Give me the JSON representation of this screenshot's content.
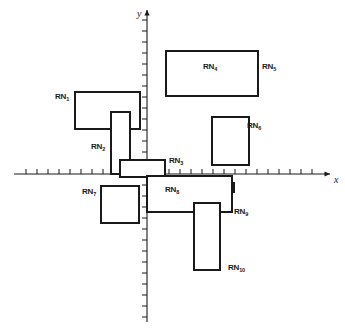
{
  "figure": {
    "type": "coordinate-plane-rectangle-diagram",
    "axes": {
      "x_label": "x",
      "y_label": "y",
      "origin_px": {
        "x": 147,
        "y": 174
      },
      "x_axis_span_px": {
        "from": 14,
        "to": 330
      },
      "y_axis_span_px": {
        "from": 10,
        "to": 322
      },
      "tick_spacing_px": 11,
      "tick_length_px": 5,
      "grid": false,
      "numeric_tick_labels": false
    },
    "rectangles": [
      {
        "id": "RN1",
        "label": "RN",
        "subscript": "1",
        "label_x": 55,
        "label_y": 93,
        "x": 75,
        "y": 92,
        "width": 65,
        "height": 37,
        "quadrant": "II"
      },
      {
        "id": "RN2",
        "label": "RN",
        "subscript": "2",
        "label_x": 91,
        "label_y": 143,
        "x": 111,
        "y": 112,
        "width": 19,
        "height": 62,
        "quadrant": "II"
      },
      {
        "id": "RN3",
        "label": "RN",
        "subscript": "3",
        "label_x": 169,
        "label_y": 157,
        "x": 120,
        "y": 160,
        "width": 45,
        "height": 17,
        "quadrant": "II-I-III-IV"
      },
      {
        "id": "RN4",
        "label": "RN",
        "subscript": "4",
        "label_x": 203,
        "label_y": 63,
        "x": 168,
        "y": 58,
        "width": 34,
        "height": 38,
        "quadrant": "I"
      },
      {
        "id": "RN5",
        "label": "RN",
        "subscript": "5",
        "label_x": 262,
        "label_y": 63,
        "x": 166,
        "y": 51,
        "width": 92,
        "height": 45,
        "quadrant": "I"
      },
      {
        "id": "RN6",
        "label": "RN",
        "subscript": "6",
        "label_x": 247,
        "label_y": 122,
        "x": 212,
        "y": 117,
        "width": 37,
        "height": 48,
        "quadrant": "I"
      },
      {
        "id": "RN7",
        "label": "RN",
        "subscript": "7",
        "label_x": 82,
        "label_y": 188,
        "x": 101,
        "y": 186,
        "width": 38,
        "height": 37,
        "quadrant": "III"
      },
      {
        "id": "RN8",
        "label": "RN",
        "subscript": "8",
        "label_x": 165,
        "label_y": 186,
        "x": 186,
        "y": 183,
        "width": 48,
        "height": 9,
        "quadrant": "IV"
      },
      {
        "id": "RN9",
        "label": "RN",
        "subscript": "9",
        "label_x": 234,
        "label_y": 208,
        "x": 147,
        "y": 176,
        "width": 85,
        "height": 36,
        "quadrant": "IV"
      },
      {
        "id": "RN10",
        "label": "RN",
        "subscript": "10",
        "label_x": 228,
        "label_y": 264,
        "x": 194,
        "y": 203,
        "width": 26,
        "height": 67,
        "quadrant": "IV"
      }
    ]
  }
}
